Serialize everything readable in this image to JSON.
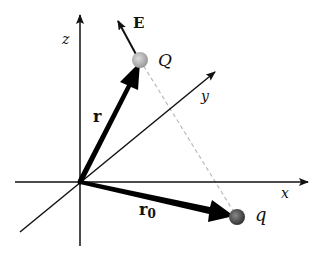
{
  "diagram": {
    "axes": {
      "x_label": "x",
      "y_label": "y",
      "z_label": "z"
    },
    "charges": {
      "source": {
        "label": "q",
        "color": "#555555"
      },
      "field_point": {
        "label": "Q",
        "color": "#b0b0b0"
      }
    },
    "vectors": {
      "r": {
        "label": "r"
      },
      "r0": {
        "label": "r",
        "subscript": "0"
      },
      "E": {
        "label": "E"
      }
    },
    "colors": {
      "axis": "#111111",
      "dashed": "#bbbbbb"
    }
  }
}
